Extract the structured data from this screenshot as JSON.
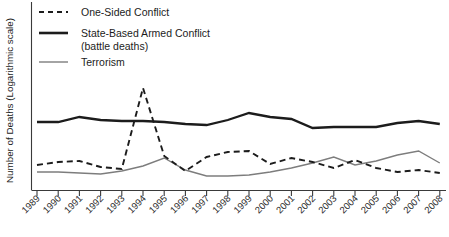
{
  "chart_data": {
    "type": "line",
    "title": "",
    "xlabel": "",
    "ylabel": "Number of Deaths (Logarithmic scale)",
    "yscale": "log",
    "grid": false,
    "legend_position": "top-left",
    "axis_ticks_y_labels": [],
    "categories": [
      "1989",
      "1990",
      "1991",
      "1992",
      "1993",
      "1994",
      "1995",
      "1996",
      "1997",
      "1998",
      "1999",
      "2000",
      "2001",
      "2002",
      "2003",
      "2004",
      "2005",
      "2006",
      "2007",
      "2008"
    ],
    "x": [
      1989,
      1990,
      1991,
      1992,
      1993,
      1994,
      1995,
      1996,
      1997,
      1998,
      1999,
      2000,
      2001,
      2002,
      2003,
      2004,
      2005,
      2006,
      2007,
      2008
    ],
    "xlim": [
      1989,
      2008
    ],
    "series": [
      {
        "name": "One-Sided Conflict",
        "style": "dashed",
        "color": "#1c1c1c",
        "width": 1.9,
        "values_px_y": [
          165,
          162,
          161,
          167,
          169,
          88,
          156,
          171,
          157,
          152,
          151,
          164,
          158,
          162,
          168,
          160,
          168,
          172,
          170,
          173
        ]
      },
      {
        "name": "State-Based Armed Conflict (battle deaths)",
        "style": "solid",
        "color": "#1c1c1c",
        "width": 2.3,
        "values_px_y": [
          122,
          122,
          117,
          120,
          121,
          121,
          122,
          124,
          125,
          120,
          113,
          117,
          119,
          128,
          127,
          127,
          127,
          123,
          121,
          124
        ]
      },
      {
        "name": "Terrorism",
        "style": "solid",
        "color": "#7d7d7d",
        "width": 1.4,
        "values_px_y": [
          172,
          172,
          173,
          174,
          171,
          166,
          158,
          170,
          176,
          176,
          175,
          172,
          168,
          163,
          157,
          165,
          161,
          155,
          151,
          163
        ]
      }
    ]
  },
  "legend": {
    "items": [
      {
        "label": "One-Sided Conflict",
        "style": "dashed"
      },
      {
        "label": "State-Based Armed Conflict",
        "label2": "(battle deaths)",
        "style": "solid-thick"
      },
      {
        "label": "Terrorism",
        "style": "solid-thin"
      }
    ]
  },
  "axis": {
    "y_title": "Number of Deaths (Logarithmic scale)"
  }
}
